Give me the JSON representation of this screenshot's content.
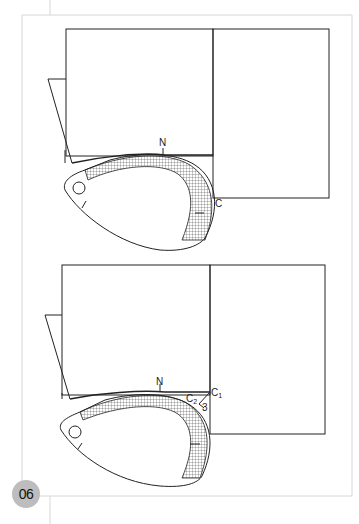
{
  "page": {
    "badge": "06"
  },
  "figures": [
    {
      "id": "top",
      "labels": {
        "n": "N",
        "c": "C"
      }
    },
    {
      "id": "bottom",
      "labels": {
        "n": "N",
        "c1": "C",
        "c1_sub": "1",
        "c2": "C",
        "c2_sub": "2",
        "dim": "3"
      }
    }
  ],
  "colors": {
    "line": "#222222",
    "frame": "#d0d0d0",
    "badge": "#bdbdbd"
  }
}
